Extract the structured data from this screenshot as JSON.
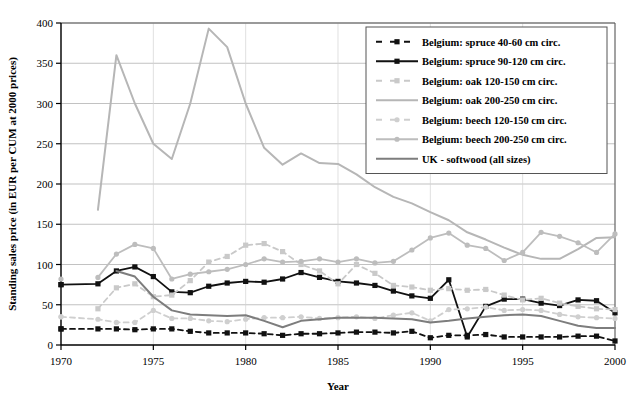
{
  "chart_data": {
    "type": "line",
    "title": "",
    "xlabel": "Year",
    "ylabel": "Standing sales price (in EUR per CUM at 2000 prices)",
    "xlim": [
      1970,
      2000
    ],
    "ylim": [
      0,
      400
    ],
    "xticks": [
      1970,
      1975,
      1980,
      1985,
      1990,
      1995,
      2000
    ],
    "yticks": [
      0,
      50,
      100,
      150,
      200,
      250,
      300,
      350,
      400
    ],
    "grid": true,
    "legend_position": "top-right",
    "series": [
      {
        "name": "Belgium: spruce 40-60 cm circ.",
        "color": "#111111",
        "style": "dashed",
        "marker": "square",
        "x": [
          1970,
          1972,
          1973,
          1974,
          1975,
          1976,
          1977,
          1978,
          1979,
          1980,
          1981,
          1982,
          1983,
          1984,
          1985,
          1986,
          1987,
          1988,
          1989,
          1990,
          1991,
          1992,
          1993,
          1994,
          1995,
          1996,
          1997,
          1998,
          1999,
          2000
        ],
        "y": [
          20,
          20,
          20,
          19,
          20,
          20,
          17,
          15,
          15,
          15,
          14,
          12,
          14,
          14,
          15,
          16,
          16,
          15,
          17,
          9,
          12,
          12,
          13,
          10,
          10,
          10,
          10,
          11,
          11,
          5
        ]
      },
      {
        "name": "Belgium: spruce 90-120 cm circ.",
        "color": "#111111",
        "style": "solid",
        "marker": "square",
        "x": [
          1970,
          1972,
          1973,
          1974,
          1975,
          1976,
          1977,
          1978,
          1979,
          1980,
          1981,
          1982,
          1983,
          1984,
          1985,
          1986,
          1987,
          1988,
          1989,
          1990,
          1991,
          1992,
          1993,
          1994,
          1995,
          1996,
          1997,
          1998,
          1999,
          2000
        ],
        "y": [
          75,
          76,
          92,
          97,
          85,
          66,
          65,
          73,
          77,
          79,
          78,
          82,
          90,
          84,
          79,
          77,
          74,
          67,
          61,
          58,
          81,
          10,
          48,
          57,
          57,
          52,
          49,
          56,
          55,
          40
        ]
      },
      {
        "name": "Belgium: oak 120-150 cm circ.",
        "color": "#c9c9c9",
        "style": "dashed",
        "marker": "square",
        "x": [
          1972,
          1973,
          1974,
          1975,
          1976,
          1977,
          1978,
          1979,
          1980,
          1981,
          1982,
          1983,
          1984,
          1985,
          1986,
          1987,
          1988,
          1989,
          1990,
          1991,
          1992,
          1993,
          1994,
          1995,
          1996,
          1997,
          1998,
          1999,
          2000
        ],
        "y": [
          45,
          71,
          76,
          60,
          62,
          80,
          103,
          110,
          124,
          126,
          116,
          100,
          92,
          76,
          100,
          89,
          74,
          72,
          68,
          70,
          68,
          69,
          62,
          56,
          58,
          52,
          48,
          45,
          44
        ]
      },
      {
        "name": "Belgium: oak 200-250 cm circ.",
        "color": "#b6b6b6",
        "style": "solid",
        "marker": "none",
        "x": [
          1972,
          1973,
          1974,
          1975,
          1976,
          1977,
          1978,
          1979,
          1980,
          1981,
          1982,
          1983,
          1984,
          1985,
          1986,
          1987,
          1988,
          1989,
          1990,
          1991,
          1992,
          1993,
          1994,
          1995,
          1996,
          1997,
          1998,
          1999,
          2000
        ],
        "y": [
          168,
          360,
          300,
          250,
          231,
          300,
          393,
          370,
          300,
          245,
          224,
          238,
          226,
          225,
          212,
          196,
          184,
          176,
          165,
          155,
          140,
          131,
          121,
          112,
          107,
          107,
          119,
          133,
          134
        ]
      },
      {
        "name": "Belgium: beech 120-150 cm circ.",
        "color": "#cfcfcf",
        "style": "dashed",
        "marker": "circle",
        "x": [
          1970,
          1972,
          1973,
          1974,
          1975,
          1976,
          1977,
          1978,
          1979,
          1980,
          1981,
          1982,
          1983,
          1984,
          1985,
          1986,
          1987,
          1988,
          1989,
          1990,
          1991,
          1992,
          1993,
          1994,
          1995,
          1996,
          1997,
          1998,
          1999,
          2000
        ],
        "y": [
          35,
          32,
          28,
          28,
          43,
          33,
          33,
          30,
          29,
          32,
          34,
          34,
          35,
          33,
          34,
          35,
          33,
          37,
          40,
          30,
          44,
          45,
          47,
          43,
          44,
          43,
          38,
          35,
          34,
          33
        ]
      },
      {
        "name": "Belgium: beech 200-250 cm circ.",
        "color": "#bdbdbd",
        "style": "solid",
        "marker": "circle",
        "x": [
          1972,
          1973,
          1974,
          1975,
          1976,
          1977,
          1978,
          1979,
          1980,
          1981,
          1982,
          1983,
          1984,
          1985,
          1986,
          1987,
          1988,
          1989,
          1990,
          1991,
          1992,
          1993,
          1994,
          1995,
          1996,
          1997,
          1998,
          1999,
          2000
        ],
        "y": [
          84,
          113,
          125,
          120,
          82,
          88,
          91,
          94,
          100,
          107,
          103,
          104,
          107,
          103,
          107,
          102,
          104,
          118,
          133,
          139,
          124,
          120,
          105,
          115,
          140,
          135,
          127,
          115,
          138
        ]
      },
      {
        "name": "UK - softwood (all sizes)",
        "color": "#7d7d7d",
        "style": "solid",
        "marker": "none",
        "x": [
          1973,
          1974,
          1975,
          1976,
          1977,
          1978,
          1979,
          1980,
          1981,
          1982,
          1983,
          1984,
          1985,
          1986,
          1987,
          1988,
          1989,
          1990,
          1991,
          1992,
          1993,
          1994,
          1995,
          1996,
          1997,
          1998,
          1999,
          2000
        ],
        "y": [
          92,
          85,
          60,
          43,
          38,
          37,
          36,
          37,
          30,
          22,
          30,
          32,
          34,
          34,
          34,
          33,
          32,
          28,
          30,
          33,
          35,
          37,
          38,
          36,
          30,
          24,
          21,
          21
        ]
      }
    ],
    "extra_points": [
      {
        "series": "Belgium: spruce 90-120 cm circ.",
        "x": 1970,
        "y": 75,
        "color": "#111111",
        "marker": "square"
      },
      {
        "series": "Belgium: spruce 40-60 cm circ.",
        "x": 1970,
        "y": 20,
        "color": "#111111",
        "marker": "square"
      },
      {
        "series": "Belgium: beech 200-250 cm circ.",
        "x": 1970,
        "y": 82,
        "color": "#bdbdbd",
        "marker": "circle"
      },
      {
        "series": "Belgium: beech 120-150 cm circ.",
        "x": 1970,
        "y": 35,
        "color": "#cfcfcf",
        "marker": "circle"
      }
    ]
  },
  "axes": {
    "y_title": "Standing sales price (in EUR per CUM at 2000 prices)",
    "x_title": "Year",
    "y_tick_labels": [
      "0",
      "50",
      "100",
      "150",
      "200",
      "250",
      "300",
      "350",
      "400"
    ],
    "x_tick_labels": [
      "1970",
      "1975",
      "1980",
      "1985",
      "1990",
      "1995",
      "2000"
    ]
  },
  "legend": {
    "items": [
      {
        "label": "Belgium: spruce 40-60 cm circ."
      },
      {
        "label": "Belgium: spruce 90-120 cm circ."
      },
      {
        "label": "Belgium: oak 120-150 cm circ."
      },
      {
        "label": "Belgium: oak 200-250 cm circ."
      },
      {
        "label": "Belgium: beech 120-150 cm circ."
      },
      {
        "label": "Belgium: beech 200-250 cm circ."
      },
      {
        "label": "UK - softwood (all sizes)"
      }
    ]
  }
}
